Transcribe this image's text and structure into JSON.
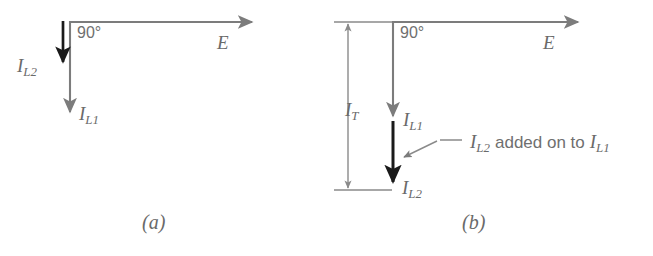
{
  "figure": {
    "colors": {
      "vector_gray": "#7c7c7c",
      "vector_black": "#1a1a1a",
      "text_gray": "#6a6a6a",
      "background": "#ffffff"
    },
    "panels": [
      {
        "id": "a",
        "caption": "(a)",
        "angle_label": "90°",
        "voltage_label": "E",
        "vectors": [
          {
            "name": "I",
            "sub": "L2",
            "style": "black"
          },
          {
            "name": "I",
            "sub": "L1",
            "style": "gray"
          }
        ],
        "labels": {
          "il2": {
            "base": "I",
            "sub": "L2"
          },
          "il1": {
            "base": "I",
            "sub": "L1"
          }
        }
      },
      {
        "id": "b",
        "caption": "(b)",
        "angle_label": "90°",
        "voltage_label": "E",
        "vectors": [
          {
            "name": "I",
            "sub": "L1",
            "style": "gray"
          },
          {
            "name": "I",
            "sub": "L2",
            "style": "black"
          },
          {
            "name": "I",
            "sub": "T",
            "style": "dimension"
          }
        ],
        "labels": {
          "it": {
            "base": "I",
            "sub": "T"
          },
          "il1": {
            "base": "I",
            "sub": "L1"
          },
          "il2": {
            "base": "I",
            "sub": "L2"
          }
        },
        "annotation": {
          "lead": {
            "base": "I",
            "sub": "L2"
          },
          "middle": "added on to",
          "tail": {
            "base": "I",
            "sub": "L1"
          },
          "full_text": "I_L2 added on to I_L1"
        }
      }
    ]
  }
}
